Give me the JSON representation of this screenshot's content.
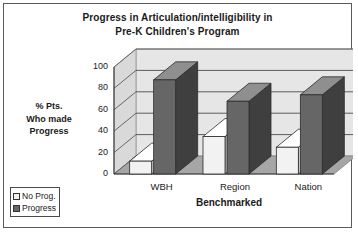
{
  "chart_data": {
    "type": "bar",
    "title": "Progress in Articulation/intelligibility in Pre-K Children's Program",
    "title_lines": [
      "Progress in Articulation/intelligibility in",
      "Pre-K Children's Program"
    ],
    "xlabel": "Benchmarked",
    "ylabel": "% Pts. Who made Progress",
    "ylabel_lines": [
      "% Pts.",
      "Who made",
      "Progress"
    ],
    "categories": [
      "WBH",
      "Region",
      "Nation"
    ],
    "series": [
      {
        "name": "No Prog.",
        "values": [
          12,
          35,
          25
        ],
        "color": "#f2f2f2"
      },
      {
        "name": "Progress",
        "values": [
          88,
          68,
          74
        ],
        "color": "#666666"
      }
    ],
    "ylim": [
      0,
      100
    ],
    "yticks": [
      "0",
      "20",
      "40",
      "60",
      "80",
      "100"
    ],
    "grid": true,
    "legend_position": "bottom-left",
    "style": "3d-clustered-column"
  },
  "legend": {
    "items": [
      {
        "label": "No Prog.",
        "color": "#f2f2f2"
      },
      {
        "label": "Progress",
        "color": "#666666"
      }
    ]
  },
  "colors": {
    "plot_back": "#e6e6e6",
    "plot_floor": "#a6a6a6",
    "border": "#5a5a5a",
    "text": "#1a1a1a",
    "gridline": "#4d4d4d"
  }
}
